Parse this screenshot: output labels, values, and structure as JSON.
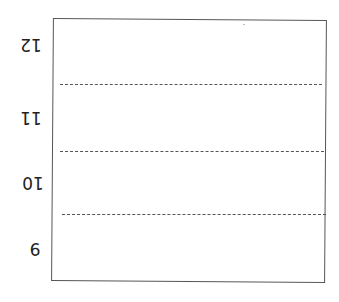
{
  "diagram": {
    "orientation": "rotated-180",
    "labels": [
      {
        "text": "12",
        "y": 35
      },
      {
        "text": "11",
        "y": 108
      },
      {
        "text": "10",
        "y": 173
      },
      {
        "text": "9",
        "y": 239
      }
    ],
    "grid_lines_y": [
      84,
      151,
      214
    ],
    "colors": {
      "frame": "#555555",
      "text": "#222222",
      "background": "#ffffff"
    }
  }
}
